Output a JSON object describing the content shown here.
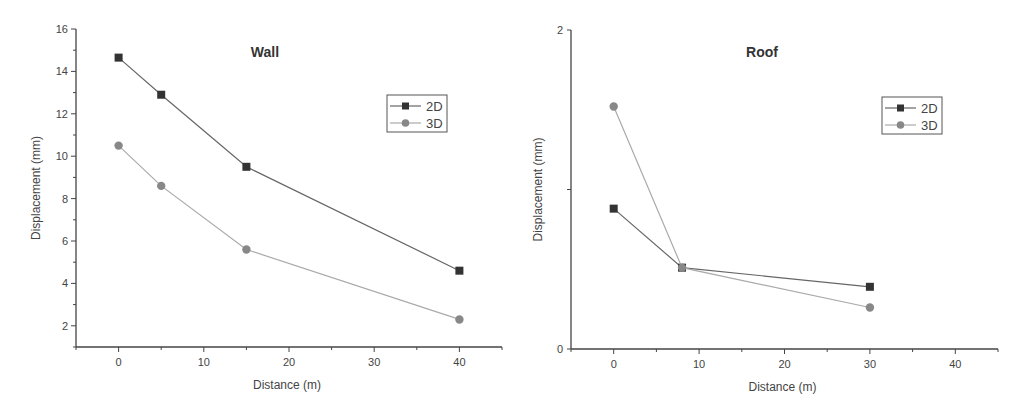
{
  "chart_data": [
    {
      "type": "line",
      "title": "Wall",
      "xlabel": "Distance (m)",
      "ylabel": "Displacement (mm)",
      "xlim": [
        -5,
        45
      ],
      "ylim": [
        1,
        16
      ],
      "xticks": [
        0,
        10,
        20,
        30,
        40
      ],
      "yticks": [
        2,
        4,
        6,
        8,
        10,
        12,
        14,
        16
      ],
      "grid": false,
      "legend_position": "upper right",
      "series": [
        {
          "name": "2D",
          "marker": "square",
          "color": "#333333",
          "line_color": "#666666",
          "x": [
            0,
            5,
            15,
            40
          ],
          "y": [
            14.65,
            12.9,
            9.5,
            4.6
          ]
        },
        {
          "name": "3D",
          "marker": "circle",
          "color": "#888888",
          "line_color": "#aaaaaa",
          "x": [
            0,
            5,
            15,
            40
          ],
          "y": [
            10.5,
            8.6,
            5.6,
            2.3
          ]
        }
      ]
    },
    {
      "type": "line",
      "title": "Roof",
      "xlabel": "Distance (m)",
      "ylabel": "Displacement (mm)",
      "xlim": [
        -5,
        45
      ],
      "ylim": [
        0,
        2
      ],
      "xticks": [
        0,
        10,
        20,
        30,
        40
      ],
      "yticks": [
        0,
        2
      ],
      "grid": false,
      "legend_position": "upper right",
      "series": [
        {
          "name": "2D",
          "marker": "square",
          "color": "#333333",
          "line_color": "#666666",
          "x": [
            0,
            8,
            30
          ],
          "y": [
            0.88,
            0.51,
            0.39
          ]
        },
        {
          "name": "3D",
          "marker": "circle",
          "color": "#888888",
          "line_color": "#aaaaaa",
          "x": [
            0,
            8,
            30
          ],
          "y": [
            1.52,
            0.51,
            0.26
          ]
        }
      ]
    }
  ],
  "panels": [
    {
      "box": {
        "left": 76,
        "right": 502,
        "top": 29,
        "bottom": 347
      },
      "legend": {
        "x": 387,
        "y": 95,
        "w": 60,
        "h": 37
      }
    },
    {
      "box": {
        "left": 571,
        "right": 998,
        "top": 30,
        "bottom": 349
      },
      "legend": {
        "x": 882,
        "y": 97,
        "w": 60,
        "h": 37
      }
    }
  ]
}
